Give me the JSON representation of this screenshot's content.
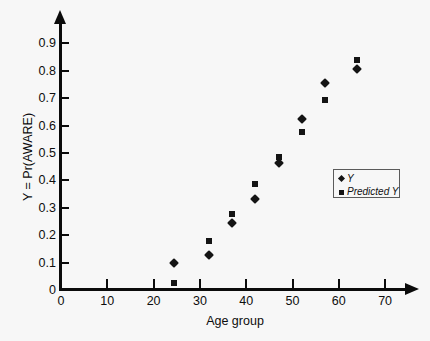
{
  "chart_data": {
    "type": "scatter",
    "title": "",
    "xlabel": "Age group",
    "ylabel": "Y = Pr(AWARE)",
    "xlim": [
      0,
      75
    ],
    "ylim": [
      0,
      0.95
    ],
    "grid": false,
    "legend_position": "center-right",
    "x_ticks": [
      0,
      10,
      20,
      30,
      40,
      50,
      60,
      70
    ],
    "x_tick_labels": [
      "0",
      "10",
      "20",
      "30",
      "40",
      "50",
      "60",
      "70"
    ],
    "y_ticks": [
      0,
      0.1,
      0.2,
      0.3,
      0.4,
      0.5,
      0.6,
      0.7,
      0.8,
      0.9
    ],
    "y_tick_labels": [
      "0",
      "0.1",
      "0.2",
      "0.3",
      "0.4",
      "0.5",
      "0.6",
      "0.7",
      "0.8",
      "0.9"
    ],
    "x": [
      24.5,
      32,
      37,
      42,
      47,
      52,
      57,
      64
    ],
    "series": [
      {
        "name": "Y",
        "marker": "diamond",
        "color": "#141414",
        "values": [
          0.098,
          0.128,
          0.243,
          0.332,
          0.462,
          0.625,
          0.755,
          0.805
        ]
      },
      {
        "name": "Predicted Y",
        "marker": "square",
        "color": "#141414",
        "values": [
          0.026,
          0.178,
          0.278,
          0.388,
          0.485,
          0.578,
          0.695,
          0.838
        ]
      }
    ]
  },
  "axes": {
    "x_title": "Age group",
    "y_title": "Y = Pr(AWARE)"
  },
  "legend": {
    "entries": [
      {
        "label": "Y",
        "marker": "diamond-marker-icon"
      },
      {
        "label": "Predicted Y",
        "marker": "square-marker-icon"
      }
    ]
  },
  "colors": {
    "background": "#f7f7f7",
    "axis": "#0b0b0b",
    "marker": "#141414",
    "legend_border": "#5b5b5b"
  }
}
